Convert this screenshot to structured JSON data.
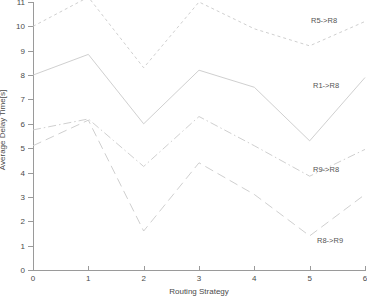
{
  "chart_data": {
    "type": "line",
    "title": "",
    "xlabel": "Routing Strategy",
    "ylabel": "Average Delay Time[s]",
    "xlim": [
      0,
      6
    ],
    "ylim": [
      0,
      11
    ],
    "xticks": [
      "0",
      "1",
      "2",
      "3",
      "4",
      "5",
      "6"
    ],
    "yticks": [
      "0",
      "1",
      "2",
      "3",
      "4",
      "5",
      "6",
      "7",
      "8",
      "9",
      "10",
      "11"
    ],
    "grid": false,
    "legend_position": "inline-right-annotations",
    "x": [
      0,
      1,
      2,
      3,
      4,
      5,
      6
    ],
    "series": [
      {
        "name": "R5->R8",
        "style": "dotted",
        "values": [
          10.0,
          11.2,
          8.3,
          11.0,
          9.9,
          9.2,
          10.2
        ],
        "annotation": "R5->R8"
      },
      {
        "name": "R1->R8",
        "style": "solid",
        "values": [
          8.0,
          8.85,
          6.0,
          8.2,
          7.5,
          5.3,
          7.9
        ],
        "annotation": "R1->R8"
      },
      {
        "name": "R9->R8",
        "style": "dash-dot",
        "values": [
          5.75,
          6.2,
          4.25,
          6.3,
          5.1,
          3.85,
          4.95
        ],
        "annotation": "R9->R8"
      },
      {
        "name": "R8->R9",
        "style": "dashed",
        "values": [
          5.1,
          6.15,
          1.6,
          4.4,
          3.1,
          1.4,
          3.1
        ],
        "annotation": "R8->R9"
      }
    ],
    "colors": {
      "axis": "#9a9a9a",
      "text": "#4a4a4a",
      "line": "#c9c9c9"
    }
  },
  "annotations": {
    "s0": "R5->R8",
    "s1": "R1->R8",
    "s2": "R9->R8",
    "s3": "R8->R9"
  }
}
